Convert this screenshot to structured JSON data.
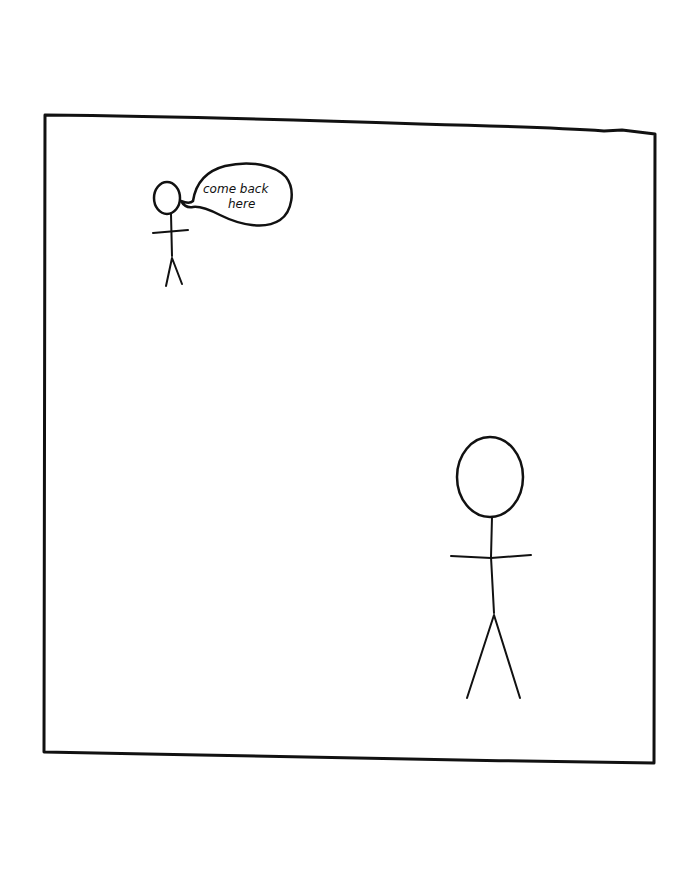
{
  "comic": {
    "panel": {
      "border_color": "#111111",
      "background": "#ffffff"
    },
    "small_figure": {
      "speech_bubble": {
        "line1": "come back",
        "line2": "here"
      }
    },
    "large_figure": {}
  }
}
